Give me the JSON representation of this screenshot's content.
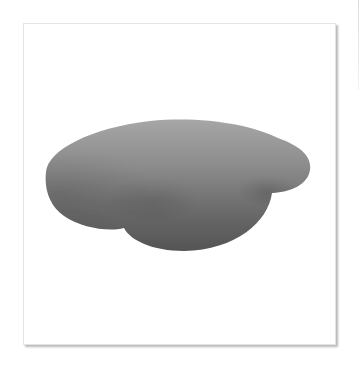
{
  "image": {
    "subject": "smooth-gray-three-lobed-blob",
    "background_color": "#ffffff",
    "frame": {
      "border_color": "#e4e4e4",
      "shadow_color": "#9a9a9a"
    },
    "blob": {
      "gradient_top": "#a4a4a4",
      "gradient_mid": "#7a7a7a",
      "gradient_bottom": "#555555"
    }
  }
}
